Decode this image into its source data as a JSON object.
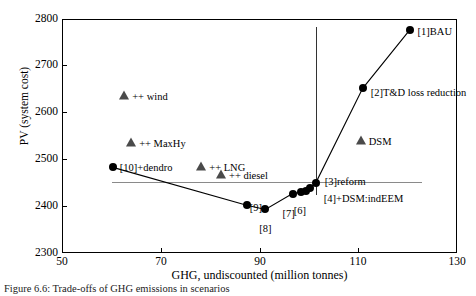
{
  "chart_data": {
    "type": "scatter",
    "title": "",
    "xlabel": "GHG, undiscounted (million tonnes)",
    "ylabel": "PV (system cost)",
    "xlim": [
      50,
      130
    ],
    "ylim": [
      2300,
      2800
    ],
    "xticks": [
      50,
      70,
      90,
      110,
      130
    ],
    "yticks": [
      2300,
      2400,
      2500,
      2600,
      2700,
      2800
    ],
    "grid": false,
    "legend": "none",
    "series": [
      {
        "name": "scenario-frontier",
        "marker": "circle",
        "line": true,
        "points": [
          {
            "label": "[1]BAU",
            "x": 120.4,
            "y": 2776
          },
          {
            "label": "[2]T&D loss reduction",
            "x": 110.9,
            "y": 2652
          },
          {
            "label": "[3]reform",
            "x": 101.4,
            "y": 2450
          },
          {
            "label": "[4]+DSM:indEEM",
            "x": 100.2,
            "y": 2438
          },
          {
            "label": "[5]",
            "x": 99.4,
            "y": 2432
          },
          {
            "label": "[6]",
            "x": 98.4,
            "y": 2430
          },
          {
            "label": "[7]",
            "x": 96.7,
            "y": 2427
          },
          {
            "label": "[8]",
            "x": 91.2,
            "y": 2393
          },
          {
            "label": "[9]",
            "x": 87.4,
            "y": 2402
          },
          {
            "label": "[10]+dendro",
            "x": 60.3,
            "y": 2483
          }
        ]
      },
      {
        "name": "sensitivity-variants",
        "marker": "triangle",
        "line": false,
        "points": [
          {
            "label": "++ wind",
            "x": 62.6,
            "y": 2636
          },
          {
            "label": "++ MaxHy",
            "x": 64.0,
            "y": 2535
          },
          {
            "label": "++ LNG",
            "x": 78.2,
            "y": 2484
          },
          {
            "label": "++ diesel",
            "x": 82.2,
            "y": 2467
          },
          {
            "label": "DSM",
            "x": 110.5,
            "y": 2540
          }
        ]
      }
    ],
    "reference_lines": [
      {
        "name": "horizontal-reference",
        "orientation": "horizontal",
        "y": 2452,
        "x_from": 60.2,
        "x_to": 122.9
      },
      {
        "name": "vertical-reference",
        "orientation": "vertical",
        "x": 101.4,
        "y_from": 2323,
        "y_to": 2683
      }
    ]
  },
  "caption": "Figure 6.6: Trade-offs of GHG emissions in scenarios"
}
